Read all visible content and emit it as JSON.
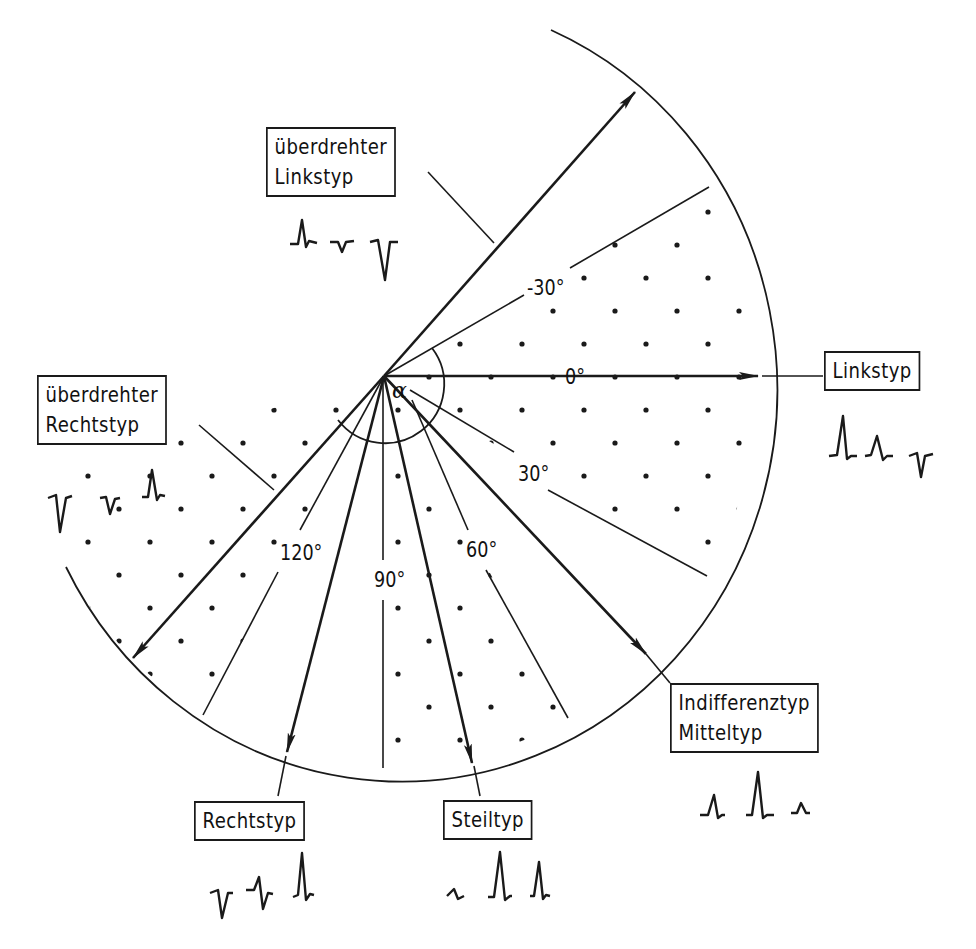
{
  "diagram": {
    "angle_symbol": "α",
    "angle_labels": [
      {
        "text": "-30°",
        "angle": -30
      },
      {
        "text": "0°",
        "angle": 0
      },
      {
        "text": "30°",
        "angle": 30
      },
      {
        "text": "60°",
        "angle": 60
      },
      {
        "text": "90°",
        "angle": 90
      },
      {
        "text": "120°",
        "angle": 120
      }
    ],
    "types": [
      {
        "id": "ueberdrehter-linkstyp",
        "line1": "überdrehter",
        "line2": "Linkstyp",
        "axis_angle": -48,
        "ecg_leads": [
          "positive-small-r",
          "small-negative",
          "deep-negative"
        ]
      },
      {
        "id": "linkstyp",
        "line1": "Linkstyp",
        "axis_angle": 0,
        "ecg_leads": [
          "tall-positive",
          "positive",
          "negative"
        ]
      },
      {
        "id": "indifferenztyp",
        "line1": "Indifferenztyp",
        "line2": "Mitteltyp",
        "axis_angle": 45,
        "ecg_leads": [
          "positive",
          "tall-positive",
          "small-positive"
        ]
      },
      {
        "id": "steiltyp",
        "line1": "Steiltyp",
        "axis_angle": 77,
        "ecg_leads": [
          "small-biphasic",
          "tall-positive",
          "positive"
        ]
      },
      {
        "id": "rechtstyp",
        "line1": "Rechtstyp",
        "axis_angle": 105,
        "ecg_leads": [
          "negative",
          "biphasic",
          "tall-positive"
        ]
      },
      {
        "id": "ueberdrehter-rechtstyp",
        "line1": "überdrehter",
        "line2": "Rechtstyp",
        "axis_angle": 140,
        "ecg_leads": [
          "deep-negative",
          "negative",
          "positive"
        ]
      }
    ],
    "shaded_ranges": [
      {
        "from": -30,
        "to": 30
      },
      {
        "from": 60,
        "to": 90
      },
      {
        "from": 120,
        "to": 152
      }
    ],
    "colors": {
      "ink": "#1a1a1a",
      "background": "#ffffff"
    }
  }
}
